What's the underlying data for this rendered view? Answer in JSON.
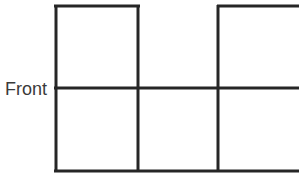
{
  "figure": {
    "title": "",
    "label_front": "Front",
    "background_color": "#ffffff",
    "line_color": "#262626",
    "line_width_px": 3,
    "text_color": "#3a3a3a",
    "unit_cell_px": 83,
    "grid": {
      "columns": 3,
      "rows": 2,
      "column_x": [
        55,
        138,
        218,
        299
      ],
      "row_y": [
        5,
        88,
        172
      ],
      "filled_cells": [
        {
          "row": 0,
          "col": 0,
          "filled": true
        },
        {
          "row": 0,
          "col": 1,
          "filled": false
        },
        {
          "row": 0,
          "col": 2,
          "filled": true
        },
        {
          "row": 1,
          "col": 0,
          "filled": true
        },
        {
          "row": 1,
          "col": 1,
          "filled": true
        },
        {
          "row": 1,
          "col": 2,
          "filled": true
        }
      ]
    },
    "segments": [
      {
        "name": "top-edge-left-box",
        "x1": 54,
        "y1": 6,
        "x2": 140,
        "y2": 6
      },
      {
        "name": "top-edge-right-box",
        "x1": 217,
        "y1": 6,
        "x2": 299,
        "y2": 6
      },
      {
        "name": "middle-horizontal",
        "x1": 54,
        "y1": 88,
        "x2": 299,
        "y2": 88
      },
      {
        "name": "bottom-horizontal",
        "x1": 54,
        "y1": 171,
        "x2": 299,
        "y2": 171
      },
      {
        "name": "left-vertical",
        "x1": 56,
        "y1": 5,
        "x2": 56,
        "y2": 172
      },
      {
        "name": "second-vertical",
        "x1": 138,
        "y1": 5,
        "x2": 138,
        "y2": 172
      },
      {
        "name": "third-vertical",
        "x1": 218,
        "y1": 5,
        "x2": 218,
        "y2": 172
      }
    ]
  }
}
